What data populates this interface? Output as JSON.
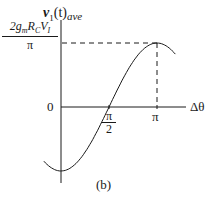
{
  "chart_data": {
    "type": "line",
    "title": "",
    "caption": "(b)",
    "xlabel": "Δθ",
    "ylabel": "v1(t)ave",
    "ylabel_parts": {
      "var": "v",
      "sub": "1",
      "arg": "(t)",
      "subscript2": "ave"
    },
    "x_ticks": [
      {
        "label": "π/2",
        "num": "π",
        "den": "2",
        "value": 1.5708
      },
      {
        "label": "π",
        "value": 3.1416
      }
    ],
    "y_ticks": [
      {
        "label": "0",
        "value": 0
      },
      {
        "label": "2gmRCVI/π",
        "num_parts": [
          "2g",
          "m",
          "R",
          "C",
          "V",
          "I"
        ],
        "den": "π",
        "value": 1
      }
    ],
    "series": [
      {
        "name": "v1(t)ave",
        "function": "-(2gmRCVI/π)·cos(Δθ)",
        "x": [
          -0.6,
          0,
          0.5,
          1.0,
          1.5708,
          2.0,
          2.5,
          3.1416,
          3.6
        ],
        "values": [
          -0.83,
          -1.0,
          -0.88,
          -0.54,
          0.0,
          0.42,
          0.8,
          1.0,
          0.9
        ]
      }
    ],
    "annotations": [
      {
        "type": "dashed-hline",
        "y": 1,
        "from_x": 0,
        "to_x": 3.1416
      },
      {
        "type": "dashed-vline",
        "x": 3.1416,
        "from_y": 0,
        "to_y": 1
      }
    ],
    "grid": false,
    "legend": null
  },
  "labels": {
    "y_var": "v",
    "y_sub": "1",
    "y_arg": "(t)",
    "y_ave": "ave",
    "peak_num_2g": "2g",
    "peak_num_m": "m",
    "peak_num_R": "R",
    "peak_num_C": "C",
    "peak_num_V": "V",
    "peak_num_I": "I",
    "peak_den": "π",
    "zero": "0",
    "x_axis": "Δθ",
    "half_pi_num": "π",
    "half_pi_den": "2",
    "pi": "π",
    "caption": "(b)"
  }
}
